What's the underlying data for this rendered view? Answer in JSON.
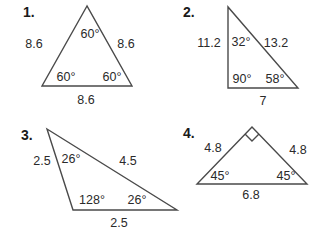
{
  "problems": [
    {
      "number": "1.",
      "vertices": [
        [
          87,
          6
        ],
        [
          42,
          86
        ],
        [
          132,
          86
        ]
      ],
      "sides": {
        "left": "8.6",
        "right": "8.6",
        "bottom": "8.6"
      },
      "angles": {
        "top": "60°",
        "bottom_left": "60°",
        "bottom_right": "60°"
      }
    },
    {
      "number": "2.",
      "vertices": [
        [
          228,
          7
        ],
        [
          228,
          88
        ],
        [
          298,
          88
        ]
      ],
      "sides": {
        "left": "11.2",
        "hypotenuse": "13.2",
        "bottom": "7"
      },
      "angles": {
        "top": "32°",
        "bottom_left": "90°",
        "bottom_right": "58°"
      }
    },
    {
      "number": "3.",
      "vertices": [
        [
          47,
          129
        ],
        [
          73,
          210
        ],
        [
          177,
          210
        ]
      ],
      "sides": {
        "left": "2.5",
        "long": "4.5",
        "bottom": "2.5"
      },
      "angles": {
        "top": "26°",
        "bottom_left": "128°",
        "bottom_right": "26°"
      }
    },
    {
      "number": "4.",
      "vertices": [
        [
          252,
          127
        ],
        [
          197,
          184
        ],
        [
          307,
          184
        ]
      ],
      "sides": {
        "left": "4.8",
        "right": "4.8",
        "bottom": "6.8"
      },
      "angles": {
        "top": "right-angle-marker",
        "bottom_left": "45°",
        "bottom_right": "45°"
      }
    }
  ],
  "colors": {
    "line": "#4a4a4a",
    "text": "#2a2a2a",
    "background": "#ffffff"
  }
}
